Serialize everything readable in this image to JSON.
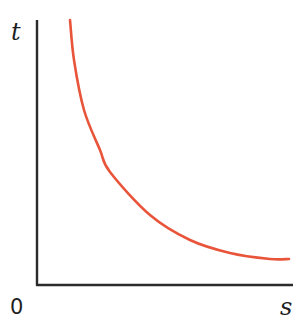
{
  "chart_data": {
    "type": "line",
    "title": "",
    "xlabel": "s",
    "ylabel": "t",
    "origin_label": "0",
    "grid": false,
    "legend": null,
    "x_ticks": [],
    "y_ticks": [],
    "series": [
      {
        "name": "t vs s",
        "color": "#e8553a",
        "points_px": [
          [
            70,
            20
          ],
          [
            74,
            60
          ],
          [
            84,
            110
          ],
          [
            100,
            150
          ],
          [
            110,
            172
          ],
          [
            150,
            215
          ],
          [
            190,
            240
          ],
          [
            230,
            253
          ],
          [
            270,
            259
          ],
          [
            289,
            259
          ]
        ]
      }
    ]
  },
  "axes": {
    "origin_px": [
      37,
      285
    ],
    "y_top_px": 20,
    "x_right_px": 293,
    "color": "#2b2b2b"
  },
  "labels": {
    "y_axis": "t",
    "x_axis": "s",
    "origin": "0"
  }
}
